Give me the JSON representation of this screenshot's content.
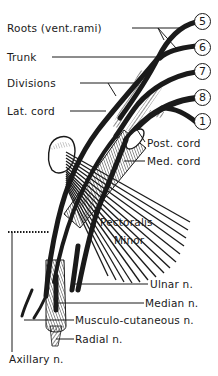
{
  "diagram": {
    "labels": {
      "roots": "Roots (vent.rami)",
      "trunk": "Trunk",
      "divisions": "Divisions",
      "lat_cord": "Lat. cord",
      "post_cord": "Post. cord",
      "med_cord": "Med. cord",
      "pectoralis": "Pectoralis",
      "minor": "Minor",
      "ulnar": "Ulnar n.",
      "median": "Median n.",
      "musculo": "Musculo-cutaneous n.",
      "radial": "Radial n.",
      "axillary": "Axillary n."
    },
    "root_numbers": [
      "5",
      "6",
      "7",
      "8",
      "1"
    ],
    "colors": {
      "ink": "#1a1a1a",
      "background": "#ffffff"
    }
  }
}
